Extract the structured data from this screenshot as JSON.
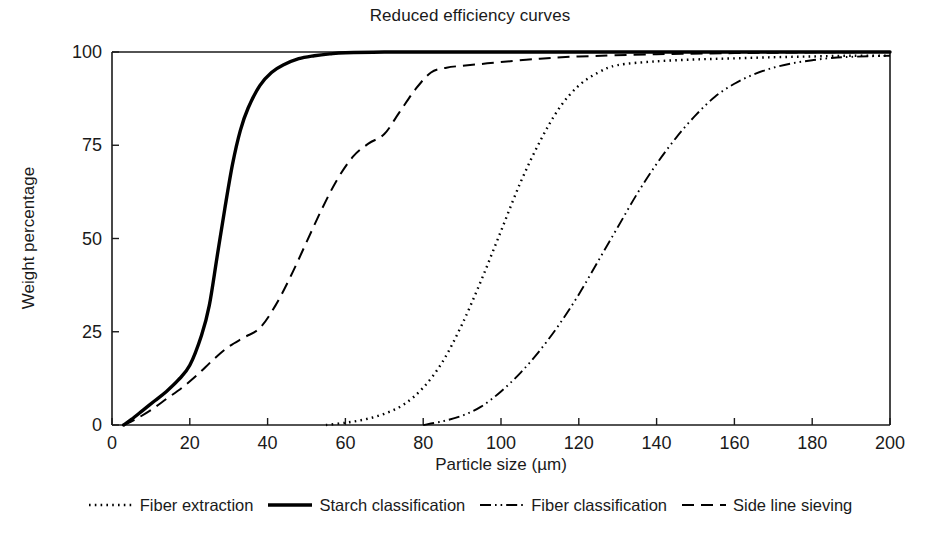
{
  "chart_data": {
    "type": "line",
    "title": "Reduced efficiency curves",
    "xlabel": "Particle size (µm)",
    "ylabel": "Weight percentage",
    "xlim": [
      0,
      200
    ],
    "ylim": [
      0,
      100
    ],
    "xticks": [
      0,
      20,
      40,
      60,
      80,
      100,
      120,
      140,
      160,
      180,
      200
    ],
    "yticks": [
      0,
      25,
      50,
      75,
      100
    ],
    "grid": false,
    "legend_position": "bottom",
    "series": [
      {
        "name": "Fiber extraction",
        "style": "dotted",
        "color": "#000000",
        "x": [
          55,
          60,
          65,
          70,
          75,
          80,
          85,
          90,
          95,
          100,
          105,
          110,
          115,
          120,
          125,
          130,
          140,
          150,
          160,
          170,
          180,
          190,
          200
        ],
        "y": [
          0,
          0.6,
          1.5,
          3,
          5.5,
          10,
          17,
          27,
          39,
          52,
          65,
          76,
          85,
          91,
          94.5,
          96.5,
          97.5,
          98,
          98.3,
          98.6,
          98.8,
          99,
          99
        ]
      },
      {
        "name": "Starch classification",
        "style": "solid",
        "color": "#000000",
        "x": [
          3,
          5,
          8,
          11,
          14,
          17,
          20,
          23,
          25,
          27,
          29,
          31,
          33,
          35,
          38,
          41,
          44,
          48,
          52,
          56,
          60,
          70,
          80,
          100,
          120,
          150,
          180,
          200
        ],
        "y": [
          0,
          1.5,
          4,
          6.5,
          9,
          12,
          16,
          24,
          32,
          45,
          58,
          70,
          79,
          85,
          91,
          94.5,
          96.5,
          98.2,
          99,
          99.5,
          99.8,
          100,
          100,
          100,
          100,
          100,
          100,
          100
        ]
      },
      {
        "name": "Fiber classification",
        "style": "dashdot",
        "color": "#000000",
        "x": [
          80,
          85,
          90,
          95,
          100,
          105,
          110,
          115,
          120,
          125,
          130,
          135,
          140,
          145,
          150,
          155,
          160,
          165,
          170,
          175,
          180,
          185,
          190,
          200
        ],
        "y": [
          0,
          1,
          2.5,
          5,
          9,
          14,
          20,
          27,
          35,
          44,
          53,
          62,
          70,
          77,
          83,
          88,
          91.5,
          94,
          95.8,
          97,
          97.8,
          98.4,
          98.7,
          99
        ]
      },
      {
        "name": "Side line sieving",
        "style": "dashed",
        "color": "#000000",
        "x": [
          3,
          6,
          10,
          14,
          18,
          22,
          26,
          30,
          34,
          38,
          42,
          46,
          50,
          54,
          58,
          62,
          66,
          70,
          74,
          78,
          82,
          86,
          90,
          95,
          100,
          110,
          120,
          140,
          160,
          180,
          200
        ],
        "y": [
          0,
          1.5,
          4,
          7,
          10,
          13.5,
          17.5,
          21,
          23.5,
          26,
          32,
          40,
          49,
          58,
          66,
          72,
          75.5,
          78,
          84,
          90,
          94.5,
          95.8,
          96.3,
          96.8,
          97.3,
          98.2,
          98.8,
          99.4,
          99.7,
          99.9,
          100
        ]
      }
    ]
  },
  "legend": {
    "items": [
      {
        "label": "Fiber extraction",
        "style": "dotted"
      },
      {
        "label": "Starch classification",
        "style": "solid"
      },
      {
        "label": "Fiber classification",
        "style": "dashdot"
      },
      {
        "label": "Side line sieving",
        "style": "dashed"
      }
    ]
  },
  "axes": {
    "x_tick_labels": [
      "0",
      "20",
      "40",
      "60",
      "80",
      "100",
      "120",
      "140",
      "160",
      "180",
      "200"
    ],
    "y_tick_labels": [
      "0",
      "25",
      "50",
      "75",
      "100"
    ]
  }
}
